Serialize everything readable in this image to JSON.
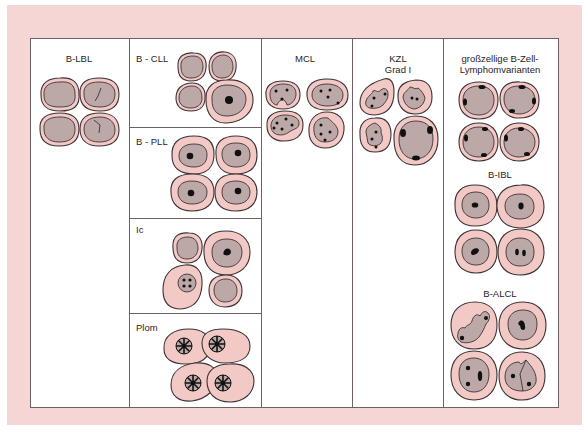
{
  "figure": {
    "colors": {
      "frame": "#f6d6d4",
      "cytoplasm": "#f2c9c5",
      "nucleus": "#bda8a8",
      "outline": "#3d3235",
      "nucleolus": "#111111"
    }
  },
  "columns": [
    {
      "id": "b-lbl",
      "label": "B-LBL"
    },
    {
      "id": "b-cll-group",
      "panels": [
        {
          "id": "b-cll",
          "label": "B - CLL"
        },
        {
          "id": "b-pll",
          "label": "B - PLL"
        },
        {
          "id": "ic",
          "label": "Ic"
        },
        {
          "id": "plom",
          "label": "Plom"
        }
      ]
    },
    {
      "id": "mcl",
      "label": "MCL"
    },
    {
      "id": "kzl",
      "label_line1": "KZL",
      "label_line2": "Grad I"
    },
    {
      "id": "large-b",
      "label_line1": "großzellige B-Zell-",
      "label_line2": "Lymphomvarianten",
      "sublabels": {
        "b_ibl": "B-IBL",
        "b_alcl": "B-ALCL"
      }
    }
  ]
}
